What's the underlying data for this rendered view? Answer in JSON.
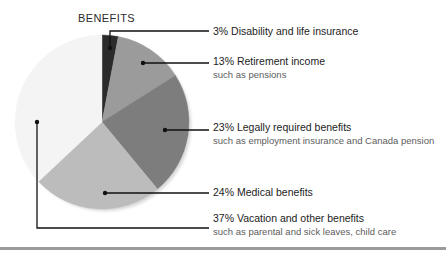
{
  "chart_data": {
    "type": "pie",
    "title": "BENEFITS",
    "xlabel": "",
    "ylabel": "",
    "legend_position": "right-callouts",
    "grid": false,
    "categories": [
      "Disability and life insurance",
      "Retirement income",
      "Legally required benefits",
      "Medical benefits",
      "Vacation and other benefits"
    ],
    "values": [
      3,
      13,
      23,
      24,
      37
    ],
    "value_unit": "%",
    "start_angle_deg": 0,
    "direction": "clockwise",
    "colors": [
      "#2b2b2b",
      "#9b9b9b",
      "#7d7d7d",
      "#bcbcbc",
      "#f4f4f4"
    ],
    "slices": [
      {
        "percent_label": "3%",
        "label": "Disability and life insurance",
        "sublabel": "",
        "value": 3,
        "color": "#2b2b2b"
      },
      {
        "percent_label": "13%",
        "label": "Retirement income",
        "sublabel": "such as pensions",
        "value": 13,
        "color": "#9b9b9b"
      },
      {
        "percent_label": "23%",
        "label": "Legally required benefits",
        "sublabel": "such as employment insurance and Canada pension",
        "value": 23,
        "color": "#7d7d7d"
      },
      {
        "percent_label": "24%",
        "label": "Medical benefits",
        "sublabel": "",
        "value": 24,
        "color": "#bcbcbc"
      },
      {
        "percent_label": "37%",
        "label": "Vacation and other benefits",
        "sublabel": "such as parental and sick leaves, child care",
        "value": 37,
        "color": "#f4f4f4"
      }
    ]
  },
  "callouts": [
    {
      "main": "3% Disability and life insurance",
      "sub": ""
    },
    {
      "main": "13% Retirement income",
      "sub": "such as pensions"
    },
    {
      "main": "23% Legally required benefits",
      "sub": "such as employment insurance and Canada pension"
    },
    {
      "main": "24% Medical benefits",
      "sub": ""
    },
    {
      "main": "37% Vacation and other benefits",
      "sub": "such as parental and sick leaves, child care"
    }
  ],
  "style": {
    "line_color": "#111111",
    "rule_color": "#9b9b9b",
    "background": "#ffffff"
  }
}
